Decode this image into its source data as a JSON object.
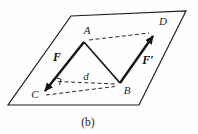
{
  "figure": {
    "caption": "(b)",
    "labels": {
      "point_a": "A",
      "point_b": "B",
      "point_c": "C",
      "point_d": "D",
      "force_f": "F",
      "force_f_prime": "F′",
      "distance": "d"
    }
  },
  "colors": {
    "ink": "#1c1c1c",
    "vector_ink": "#141414",
    "background": "#fefefe"
  }
}
